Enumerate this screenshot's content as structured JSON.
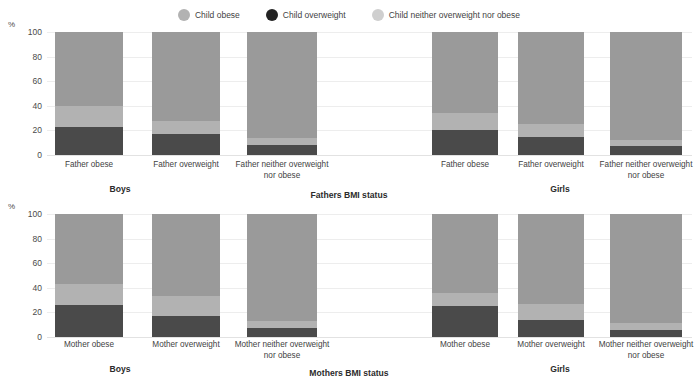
{
  "legend": {
    "items": [
      {
        "label": "Child obese",
        "color": "#9e9e9e",
        "icon": "circle-icon"
      },
      {
        "label": "Child overweight",
        "color": "#2b2b2b",
        "icon": "circle-icon"
      },
      {
        "label": "Child neither overweight nor obese",
        "color": "#c9c9c9",
        "icon": "circle-icon"
      }
    ]
  },
  "colors": {
    "child_overweight": "#4a4a4a",
    "child_obese": "#b2b2b2",
    "child_neither": "#9a9a9a",
    "gridline": "#ededed",
    "text": "#3f3f3f"
  },
  "axis": {
    "unit": "%",
    "ticks": [
      "100",
      "80",
      "60",
      "40",
      "20",
      "0"
    ],
    "ymin": 0,
    "ymax": 100
  },
  "panels": [
    {
      "id": "fathers",
      "axis_title": "Fathers BMI status",
      "groups": [
        {
          "name": "Boys",
          "label": "Boys"
        },
        {
          "name": "Girls",
          "label": "Girls"
        }
      ],
      "categories_boys": [
        "Father obese",
        "Father overweight",
        "Father neither overweight nor obese"
      ],
      "categories_girls": [
        "Father obese",
        "Father overweight",
        "Father neither overweight nor obese"
      ]
    },
    {
      "id": "mothers",
      "axis_title": "Mothers BMI status",
      "groups": [
        {
          "name": "Boys",
          "label": "Boys"
        },
        {
          "name": "Girls",
          "label": "Girls"
        }
      ],
      "categories_boys": [
        "Mother obese",
        "Mother overweight",
        "Mother neither overweight nor obese"
      ],
      "categories_girls": [
        "Mother obese",
        "Mother overweight",
        "Mother neither overweight nor obese"
      ]
    }
  ],
  "chart_data": {
    "type": "bar",
    "subtype": "stacked-100-percent",
    "title": "",
    "xlabel": "",
    "ylabel": "%",
    "ylim": [
      0,
      100
    ],
    "grid": true,
    "legend_position": "top-center",
    "series": [
      {
        "name": "Child overweight",
        "color": "#4a4a4a"
      },
      {
        "name": "Child obese",
        "color": "#b2b2b2"
      },
      {
        "name": "Child neither overweight nor obese",
        "color": "#9a9a9a"
      }
    ],
    "charts": [
      {
        "name": "Fathers BMI status",
        "axis_title": "Fathers BMI status",
        "panels": [
          {
            "group": "Boys",
            "categories": [
              "Father obese",
              "Father overweight",
              "Father neither overweight nor obese"
            ],
            "values": {
              "Child overweight": [
                23,
                17,
                8
              ],
              "Child obese": [
                17,
                11,
                6
              ],
              "Child neither overweight nor obese": [
                60,
                72,
                86
              ]
            }
          },
          {
            "group": "Girls",
            "categories": [
              "Father obese",
              "Father overweight",
              "Father neither overweight nor obese"
            ],
            "values": {
              "Child overweight": [
                20,
                15,
                7
              ],
              "Child obese": [
                14,
                10,
                5
              ],
              "Child neither overweight nor obese": [
                66,
                75,
                88
              ]
            }
          }
        ]
      },
      {
        "name": "Mothers BMI status",
        "axis_title": "Mothers BMI status",
        "panels": [
          {
            "group": "Boys",
            "categories": [
              "Mother obese",
              "Mother overweight",
              "Mother neither overweight nor obese"
            ],
            "values": {
              "Child overweight": [
                26,
                17,
                7
              ],
              "Child obese": [
                17,
                16,
                6
              ],
              "Child neither overweight nor obese": [
                57,
                67,
                87
              ]
            }
          },
          {
            "group": "Girls",
            "categories": [
              "Mother obese",
              "Mother overweight",
              "Mother neither overweight nor obese"
            ],
            "values": {
              "Child overweight": [
                25,
                14,
                6
              ],
              "Child obese": [
                11,
                13,
                5
              ],
              "Child neither overweight nor obese": [
                64,
                73,
                89
              ]
            }
          }
        ]
      }
    ]
  }
}
